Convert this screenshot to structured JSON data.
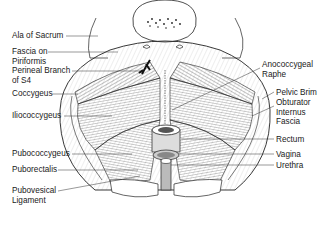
{
  "diagram": {
    "labels_left": [
      {
        "text": "Ala of Sacrum",
        "x": 12,
        "y": 31
      },
      {
        "text": "Fascia on\nPiriformis",
        "x": 12,
        "y": 48
      },
      {
        "text": "Perineal Branch\nof S4",
        "x": 12,
        "y": 67
      },
      {
        "text": "Coccygeus",
        "x": 12,
        "y": 90
      },
      {
        "text": "Iliococcygeus",
        "x": 12,
        "y": 112
      },
      {
        "text": "Pubococcygeus",
        "x": 12,
        "y": 150
      },
      {
        "text": "Puborectalis",
        "x": 12,
        "y": 166
      },
      {
        "text": "Pubovesical\nLigament",
        "x": 12,
        "y": 187
      }
    ],
    "labels_right": [
      {
        "text": "Anococcygeal\nRaphe",
        "x": 262,
        "y": 60
      },
      {
        "text": "Pelvic Brim",
        "x": 276,
        "y": 88
      },
      {
        "text": "Obturator\nInternus\nFascia",
        "x": 276,
        "y": 98
      },
      {
        "text": "Rectum",
        "x": 276,
        "y": 135
      },
      {
        "text": "Vagina",
        "x": 276,
        "y": 150
      },
      {
        "text": "Urethra",
        "x": 276,
        "y": 161
      }
    ]
  }
}
